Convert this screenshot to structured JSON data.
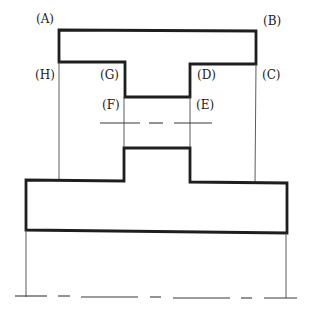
{
  "figure": {
    "type": "orthographic-projection-drawing",
    "labels": [
      {
        "id": "A",
        "text": "(A)",
        "x": 36,
        "y": 23
      },
      {
        "id": "B",
        "text": "(B)",
        "x": 263,
        "y": 25
      },
      {
        "id": "H",
        "text": "(H)",
        "x": 35,
        "y": 79
      },
      {
        "id": "G",
        "text": "(G)",
        "x": 100,
        "y": 79
      },
      {
        "id": "D",
        "text": "(D)",
        "x": 197,
        "y": 79
      },
      {
        "id": "C",
        "text": "(C)",
        "x": 262,
        "y": 79
      },
      {
        "id": "F",
        "text": "(F)",
        "x": 102,
        "y": 109
      },
      {
        "id": "E",
        "text": "(E)",
        "x": 196,
        "y": 109
      }
    ],
    "colors": {
      "outline": "#1e1e1e",
      "projection_line": "#4a4a4a",
      "center_line": "#3a3a3a",
      "background": "#ffffff"
    }
  }
}
